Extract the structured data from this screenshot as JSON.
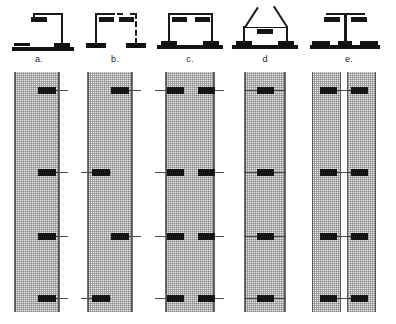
{
  "figure": {
    "panel_count": 5,
    "background_color": "#ffffff",
    "ink_color": "#151515",
    "specimen_fill_color": "#e9e9e9",
    "specimen_hatch_color": "#787878",
    "load_block_color": "#151515"
  },
  "columns": [
    {
      "id": "a",
      "label": "a.",
      "schematic": {
        "name": "cantilever-single-post",
        "description": "Single vertical reaction post at right with horizontal top arm extending left; base slab along ground at left",
        "posts": 1,
        "dashed_posts": 0,
        "diagonal_arms": 0,
        "top_blocks": 1,
        "base_pads": 2
      },
      "specimen": {
        "name": "specimen-panel-a",
        "hatched": true,
        "split": false,
        "load_points": 4,
        "load_sides": [
          "right",
          "right",
          "right",
          "right"
        ],
        "load_levels_pct": [
          7,
          41,
          68,
          94
        ]
      }
    },
    {
      "id": "b",
      "label": "b.",
      "schematic": {
        "name": "portal-frame-one-dashed-post",
        "description": "Two vertical posts, left solid and right dashed, joined by horizontal top beam with dashed right segment; two top blocks",
        "posts": 2,
        "dashed_posts": 1,
        "diagonal_arms": 0,
        "top_blocks": 2,
        "base_pads": 2
      },
      "specimen": {
        "name": "specimen-panel-b",
        "hatched": true,
        "split": false,
        "load_points": 4,
        "load_sides": [
          "right",
          "left",
          "right",
          "left"
        ],
        "load_levels_pct": [
          7,
          41,
          68,
          94
        ]
      }
    },
    {
      "id": "c",
      "label": "c.",
      "schematic": {
        "name": "portal-frame-two-posts",
        "description": "Two solid vertical posts joined by a horizontal top beam; a block near each post head; continuous base slab",
        "posts": 2,
        "dashed_posts": 0,
        "diagonal_arms": 0,
        "top_blocks": 2,
        "base_pads": 1
      },
      "specimen": {
        "name": "specimen-panel-c",
        "hatched": true,
        "split": false,
        "load_points": 8,
        "load_sides": [
          "both",
          "both",
          "both",
          "both"
        ],
        "load_levels_pct": [
          7,
          41,
          68,
          94
        ]
      }
    },
    {
      "id": "d",
      "label": "d",
      "schematic": {
        "name": "inclined-strut-frame",
        "description": "Two vertical posts with outward-inclined diagonal arms rising from their heads; horizontal tie beam with one centred block",
        "posts": 2,
        "dashed_posts": 0,
        "diagonal_arms": 2,
        "top_blocks": 1,
        "base_pads": 2
      },
      "specimen": {
        "name": "specimen-panel-d",
        "hatched": true,
        "split": false,
        "load_points": 4,
        "load_sides": [
          "center",
          "center",
          "center",
          "center"
        ],
        "load_levels_pct": [
          7,
          41,
          68,
          94
        ]
      }
    },
    {
      "id": "e",
      "label": "e.",
      "schematic": {
        "name": "centre-post-t-frame",
        "description": "Single central vertical post with T-shaped top cross beam carrying a block at each end; base slab with three pads",
        "posts": 1,
        "dashed_posts": 0,
        "diagonal_arms": 0,
        "top_blocks": 2,
        "base_pads": 3
      },
      "specimen": {
        "name": "specimen-panel-e",
        "hatched": true,
        "split": true,
        "load_points": 8,
        "load_sides": [
          "pair",
          "pair",
          "pair",
          "pair"
        ],
        "load_levels_pct": [
          7,
          41,
          68,
          94
        ]
      }
    }
  ]
}
